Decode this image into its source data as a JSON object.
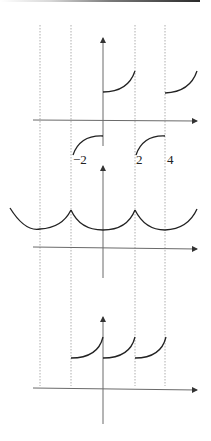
{
  "figure": {
    "guide_lines_x_values": [
      -4,
      -2,
      2,
      4
    ],
    "x_tick_labels": [
      {
        "text": "−2",
        "value": -2
      },
      {
        "text": "2",
        "value": 2
      },
      {
        "text": "4",
        "value": 4
      }
    ],
    "panels": [
      {
        "name": "top",
        "pieces": "increasing convex arcs on [0,2] and [4,6] above axis; concave arcs on [-2,0] and [2,4] below axis"
      },
      {
        "name": "middle",
        "pieces": "chain of downward semicircular arcs with cusps at x=-2 and x=2"
      },
      {
        "name": "bottom",
        "pieces": "three increasing convex arcs on [-2,0], [0,2], [2,4] above axis"
      }
    ],
    "colors": {
      "curve": "#222222",
      "axis": "#6a6a6a",
      "guide": "#9a9a9a"
    }
  }
}
